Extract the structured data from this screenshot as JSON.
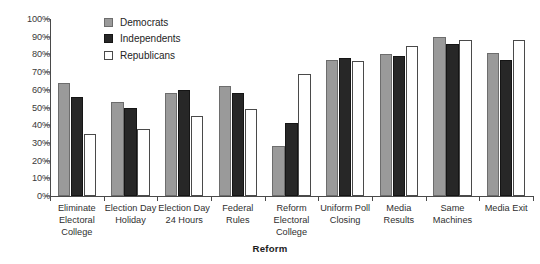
{
  "chart_data": {
    "type": "bar",
    "title": "",
    "xlabel": "Reform",
    "ylabel": "",
    "ylim": [
      0,
      100
    ],
    "ytick_labels": [
      "100%",
      "90%",
      "80%",
      "70%",
      "60%",
      "50%",
      "40%",
      "30%",
      "20%",
      "10%",
      "0%"
    ],
    "ytick_values": [
      100,
      90,
      80,
      70,
      60,
      50,
      40,
      30,
      20,
      10,
      0
    ],
    "grid": false,
    "legend_position": "top-center",
    "categories": [
      "Eliminate\nElectoral\nCollege",
      "Election Day\nHoliday",
      "Election Day\n24 Hours",
      "Federal\nRules",
      "Reform\nElectoral\nCollege",
      "Uniform Poll\nClosing",
      "Media\nResults",
      "Same\nMachines",
      "Media Exit"
    ],
    "series": [
      {
        "name": "Democrats",
        "color": "#9a9a9a",
        "values": [
          64,
          53,
          58,
          62,
          28,
          77,
          80,
          90,
          81
        ]
      },
      {
        "name": "Independents",
        "color": "#272727",
        "values": [
          56,
          50,
          60,
          58,
          41,
          78,
          79,
          86,
          77
        ]
      },
      {
        "name": "Republicans",
        "color": "#ffffff",
        "values": [
          35,
          38,
          45,
          49,
          69,
          76,
          85,
          88,
          88
        ]
      }
    ]
  }
}
